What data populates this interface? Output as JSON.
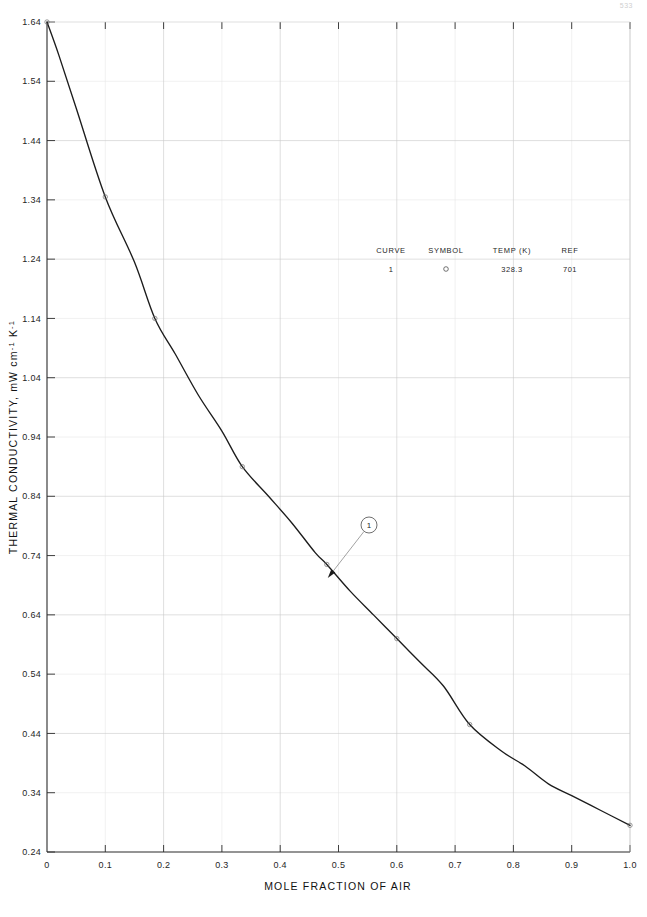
{
  "page": {
    "number": "533"
  },
  "chart_data": {
    "type": "line",
    "title": "",
    "xlabel": "MOLE FRACTION OF AIR",
    "ylabel": "THERMAL CONDUCTIVITY, mW cm",
    "ylabel_sup1": "-1",
    "ylabel_mid": " K",
    "ylabel_sup2": "-1",
    "xlim": [
      0,
      1.0
    ],
    "ylim": [
      0.24,
      1.64
    ],
    "grid": true,
    "xticks": [
      0,
      0.1,
      0.2,
      0.3,
      0.4,
      0.5,
      0.6,
      0.7,
      0.8,
      0.9,
      1.0
    ],
    "xticklabels": [
      "0",
      "0.1",
      "0.2",
      "0.3",
      "0.4",
      "0.5",
      "0.6",
      "0.7",
      "0.8",
      "0.9",
      "1.0"
    ],
    "yticks": [
      0.24,
      0.34,
      0.44,
      0.54,
      0.64,
      0.74,
      0.84,
      0.94,
      1.04,
      1.14,
      1.24,
      1.34,
      1.44,
      1.54,
      1.64
    ],
    "yticklabels": [
      "0.24",
      "0.34",
      "0.44",
      "0.54",
      "0.64",
      "0.74",
      "0.84",
      "0.94",
      "1.04",
      "1.14",
      "1.24",
      "1.34",
      "1.44",
      "1.54",
      "1.64"
    ],
    "series": [
      {
        "name": "1",
        "temp_k": "328.3",
        "ref": "701",
        "x": [
          0.0,
          0.02,
          0.05,
          0.1,
          0.15,
          0.185,
          0.22,
          0.26,
          0.3,
          0.335,
          0.38,
          0.42,
          0.46,
          0.48,
          0.52,
          0.56,
          0.6,
          0.64,
          0.68,
          0.725,
          0.78,
          0.82,
          0.86,
          0.9,
          0.95,
          1.0
        ],
        "y": [
          1.64,
          1.585,
          1.495,
          1.345,
          1.235,
          1.14,
          1.08,
          1.01,
          0.95,
          0.89,
          0.84,
          0.795,
          0.745,
          0.725,
          0.68,
          0.64,
          0.6,
          0.56,
          0.52,
          0.455,
          0.41,
          0.385,
          0.355,
          0.335,
          0.31,
          0.285
        ],
        "markers_x": [
          0.0,
          0.1,
          0.185,
          0.335,
          0.48,
          0.6,
          0.725,
          1.0
        ],
        "markers_y": [
          1.64,
          1.345,
          1.14,
          0.89,
          0.725,
          0.6,
          0.455,
          0.285
        ]
      }
    ],
    "legend": {
      "position": "upper-center",
      "headers": [
        "CURVE",
        "SYMBOL",
        "TEMP (K)",
        "REF"
      ],
      "rows": [
        {
          "curve": "1",
          "symbol": "circle",
          "temp": "328.3",
          "ref": "701"
        }
      ]
    },
    "annotations": [
      {
        "label": "1",
        "shape": "circled-number",
        "points_to_x": 0.48,
        "points_to_y": 0.7
      }
    ]
  }
}
